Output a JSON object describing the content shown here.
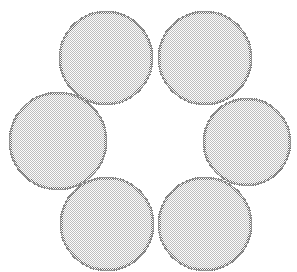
{
  "figure": {
    "width": 297,
    "height": 272,
    "background_color": "#ffffff",
    "shape_count": 6,
    "arrangement": "hexagonal-ring",
    "center_gap": "white hexagonal void"
  },
  "style": {
    "fill_color": "#c9c9c9",
    "fill_texture": "fine checkerboard halftone dither",
    "fill_dot_color": "#bdbdbd",
    "fill_gap_color": "#ffffff",
    "stroke_color": "#7a7a7a",
    "stroke_outer_color": "#8c8c8c",
    "stroke_width": 2.0,
    "texture_tile_px": 2
  },
  "chart_data": {
    "type": "scatter",
    "xlabel": "",
    "ylabel": "",
    "xlim": [
      0,
      297
    ],
    "ylim": [
      0,
      272
    ],
    "grid": false,
    "legend": "none",
    "circles": [
      {
        "id": "circle-top-left",
        "label": "Top Left",
        "cx": 106,
        "cy": 58,
        "r": 47
      },
      {
        "id": "circle-top-right",
        "label": "Top Right",
        "cx": 205,
        "cy": 58,
        "r": 47
      },
      {
        "id": "circle-mid-left",
        "label": "Middle Left",
        "cx": 58,
        "cy": 141,
        "r": 49
      },
      {
        "id": "circle-mid-right",
        "label": "Middle Right",
        "cx": 247,
        "cy": 142,
        "r": 44
      },
      {
        "id": "circle-bottom-left",
        "label": "Bottom Left",
        "cx": 107,
        "cy": 224,
        "r": 47
      },
      {
        "id": "circle-bottom-right",
        "label": "Bottom Right",
        "cx": 205,
        "cy": 224,
        "r": 47
      }
    ]
  }
}
